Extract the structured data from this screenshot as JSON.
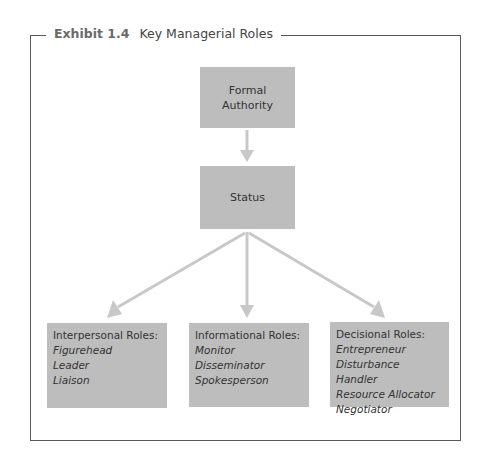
{
  "title": {
    "exhibit": "Exhibit 1.4",
    "text": "Key Managerial Roles"
  },
  "nodes": {
    "formal_authority": {
      "lines": [
        "Formal",
        "Authority"
      ]
    },
    "status": {
      "label": "Status"
    },
    "interpersonal": {
      "heading": "Interpersonal Roles:",
      "items": [
        "Figurehead",
        "Leader",
        "Liaison"
      ]
    },
    "informational": {
      "heading": "Informational Roles:",
      "items": [
        "Monitor",
        "Disseminator",
        "Spokesperson"
      ]
    },
    "decisional": {
      "heading": "Decisional Roles:",
      "items": [
        "Entrepreneur",
        "Disturbance Handler",
        "Resource Allocator",
        "Negotiator"
      ]
    }
  },
  "edges": [
    {
      "from": "Formal Authority",
      "to": "Status"
    },
    {
      "from": "Status",
      "to": "Interpersonal Roles"
    },
    {
      "from": "Status",
      "to": "Informational Roles"
    },
    {
      "from": "Status",
      "to": "Decisional Roles"
    }
  ],
  "colors": {
    "box_fill": "#bdbdbd",
    "arrow": "#c8c8c8",
    "frame": "#5a5a5a"
  }
}
